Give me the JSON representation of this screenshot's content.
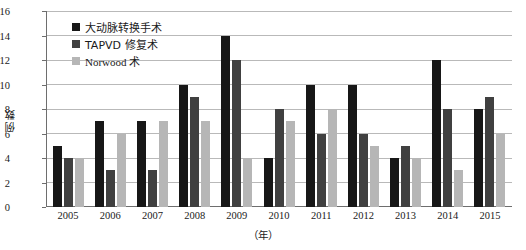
{
  "chart_data": {
    "type": "bar",
    "title": "",
    "xlabel": "（年）",
    "ylabel": "例数",
    "categories": [
      "2005",
      "2006",
      "2007",
      "2008",
      "2009",
      "2010",
      "2011",
      "2012",
      "2013",
      "2014",
      "2015"
    ],
    "series": [
      {
        "name": "大动脉转换手术",
        "color": "#171717",
        "values": [
          5,
          7,
          7,
          10,
          14,
          4,
          10,
          10,
          4,
          12,
          8
        ]
      },
      {
        "name": "TAPVD 修复术",
        "color": "#404040",
        "values": [
          4,
          3,
          3,
          9,
          12,
          8,
          6,
          6,
          5,
          8,
          9
        ]
      },
      {
        "name": "Norwood 术",
        "color": "#b6b6b6",
        "values": [
          4,
          6,
          7,
          7,
          4,
          7,
          8,
          5,
          4,
          3,
          6
        ]
      }
    ],
    "ylim": [
      0,
      16
    ],
    "ytick_step": 2,
    "yticks": [
      "0",
      "2",
      "4",
      "6",
      "8",
      "10",
      "12",
      "14",
      "16"
    ],
    "grid": true,
    "legend_position": "top-left-inside"
  }
}
